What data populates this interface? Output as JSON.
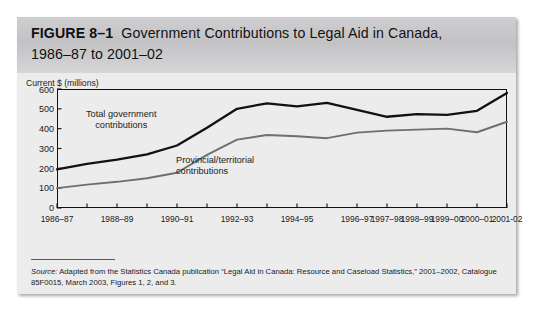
{
  "figure": {
    "label": "FIGURE 8–1",
    "title_line1": "Government Contributions to Legal Aid in Canada,",
    "title_line2": "1986–87 to 2001–02"
  },
  "axis": {
    "y_title": "Current $ (millions)",
    "y_ticks": [
      "600",
      "500",
      "400",
      "300",
      "200",
      "100",
      "0"
    ],
    "x_tick_labels": [
      "1986–87",
      "",
      "1988–89",
      "",
      "1990–91",
      "",
      "1992–93",
      "",
      "1994–95",
      "",
      "1996–97",
      "1997–98",
      "1998–99",
      "1999–00",
      "2000–01",
      "2001-02"
    ]
  },
  "annotations": {
    "total_line1": "Total government",
    "total_line2": "contributions",
    "provincial_line1": "Provincial/territorial",
    "provincial_line2": "contributions"
  },
  "source": {
    "label": "Source:",
    "text": " Adapted from the Statistics Canada publication “Legal Aid in Canada: Resource and Caseload Statistics,” 2001–2002, Catalogue 85F0015, March 2003, Figures 1, 2, and 3."
  },
  "colors": {
    "total_line": "#111111",
    "provincial_line": "#6f6f6f",
    "panel_background": "#ececed",
    "title_band": "#c8c8ca",
    "axis": "#111111"
  },
  "chart_data": {
    "type": "line",
    "title": "Government Contributions to Legal Aid in Canada, 1986–87 to 2001–02",
    "xlabel": "",
    "ylabel": "Current $ (millions)",
    "ylim": [
      0,
      600
    ],
    "grid": false,
    "legend": "in-plot annotations",
    "categories": [
      "1986–87",
      "1987–88",
      "1988–89",
      "1989–90",
      "1990–91",
      "1991–92",
      "1992–93",
      "1993–94",
      "1994–95",
      "1995–96",
      "1996–97",
      "1997–98",
      "1998–99",
      "1999–00",
      "2000–01",
      "2001–02"
    ],
    "series": [
      {
        "name": "Total government contributions",
        "color": "#111111",
        "values": [
          195,
          222,
          244,
          270,
          315,
          405,
          500,
          528,
          512,
          530,
          495,
          460,
          473,
          470,
          490,
          580
        ]
      },
      {
        "name": "Provincial/territorial contributions",
        "color": "#6f6f6f",
        "values": [
          100,
          118,
          132,
          150,
          178,
          268,
          345,
          368,
          362,
          352,
          380,
          390,
          395,
          400,
          382,
          435
        ]
      }
    ]
  }
}
